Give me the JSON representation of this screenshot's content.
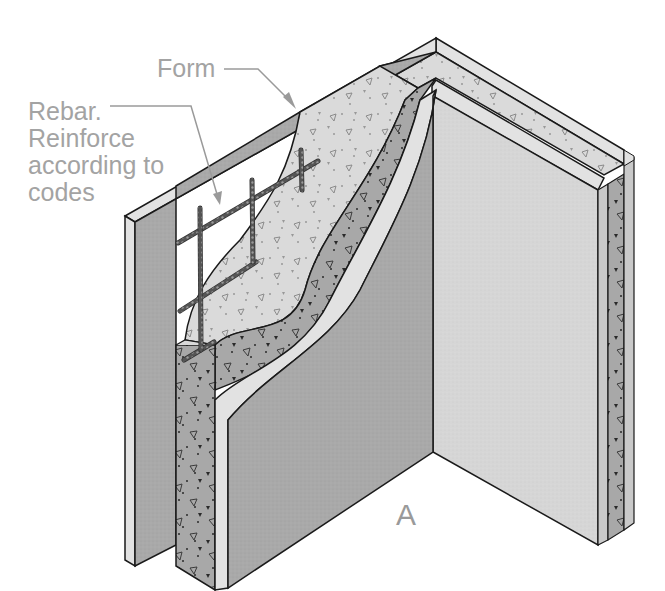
{
  "labels": {
    "form": "Form",
    "rebar": {
      "lines": [
        "Rebar.",
        "Reinforce",
        "according to",
        "codes"
      ]
    },
    "view": "A"
  },
  "colors": {
    "form_panel_face": "#a9a9a9",
    "form_panel_edge": "#e2e2e2",
    "inner_form_face": "#d6d6d6",
    "concrete_light": "#d9d9d9",
    "concrete_dark": "#a5a5a5",
    "rebar": "#5a5a5a",
    "outline": "#1a1a1a",
    "label_text": "#a3a3a3"
  },
  "components": [
    {
      "name": "outer-form-panel",
      "description": "Outer plywood form panel"
    },
    {
      "name": "inner-form-panel",
      "description": "Inner plywood form panel (cutaway)"
    },
    {
      "name": "concrete-fill",
      "description": "Poured concrete with aggregate"
    },
    {
      "name": "rebar-grid",
      "description": "Horizontal and vertical reinforcing bars"
    },
    {
      "name": "corner-return-wall",
      "description": "Perpendicular return wall section"
    }
  ]
}
